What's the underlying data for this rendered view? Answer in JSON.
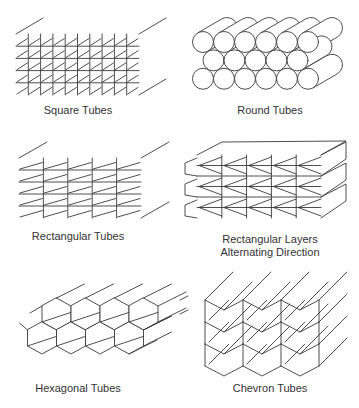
{
  "figure": {
    "line_color": "#3a3a3a",
    "background": "#ffffff",
    "panels": [
      {
        "id": "square-tubes",
        "caption_lines": [
          "Square Tubes"
        ],
        "caption_pos": [
          78,
          104
        ],
        "type": "grid",
        "x": 16,
        "y": 34,
        "cols": 10,
        "rows": 5,
        "w": 123,
        "h": 61,
        "depth": [
          27,
          -16
        ]
      },
      {
        "id": "round-tubes",
        "caption_lines": [
          "Round Tubes"
        ],
        "caption_pos": [
          270,
          104
        ],
        "type": "circles",
        "x0": 203,
        "y0": 42,
        "r": 10.5,
        "cols": 6,
        "rows": 3,
        "depth": [
          24,
          -14
        ]
      },
      {
        "id": "rectangular-tubes",
        "caption_lines": [
          "Rectangular Tubes"
        ],
        "caption_pos": [
          78,
          230
        ],
        "type": "grid",
        "x": 19,
        "y": 158,
        "cols": 5,
        "rows": 5,
        "w": 122,
        "h": 60,
        "depth": [
          28,
          -16
        ]
      },
      {
        "id": "rectangular-layers",
        "caption_lines": [
          "Rectangular Layers",
          "Alternating Direction"
        ],
        "caption_pos": [
          270,
          233
        ],
        "type": "layers",
        "x": 197,
        "y": 155,
        "cols": 5,
        "rows": 3,
        "w": 124,
        "h": 63,
        "depth": [
          25,
          -13
        ]
      },
      {
        "id": "hexagonal-tubes",
        "caption_lines": [
          "Hexagonal Tubes"
        ],
        "caption_pos": [
          78,
          382
        ],
        "type": "hexagons",
        "x0": 42,
        "y0": 314,
        "hw": 14.5,
        "hh": 16,
        "cols": 4,
        "rows": 2,
        "depth": [
          28,
          -14
        ]
      },
      {
        "id": "chevron-tubes",
        "caption_lines": [
          "Chevron Tubes"
        ],
        "caption_pos": [
          270,
          382
        ],
        "type": "chevrons",
        "x0": 205,
        "y0": 300,
        "cw": 38,
        "ch": 22,
        "dip": 10,
        "cols": 3,
        "rows": 3,
        "depth": [
          28,
          -28
        ]
      }
    ]
  }
}
